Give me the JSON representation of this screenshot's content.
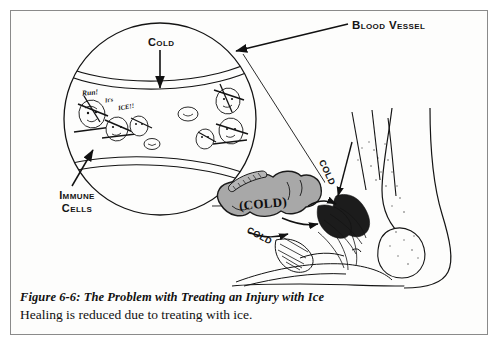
{
  "figure": {
    "caption_title": "Figure 6-6:  The Problem with Treating an Injury with Ice",
    "caption_subtitle": "Healing is reduced due to treating with ice.",
    "frame_border_color": "#8a8a8a",
    "background_color": "#fdfdfc",
    "ink_color": "#111111"
  },
  "labels": {
    "blood_vessel": "Blood Vessel",
    "cold_top": "Cold",
    "immune_cells_line1": "Immune",
    "immune_cells_line2": "Cells",
    "ice_pack": "(COLD)",
    "cold_arrow_upper": "COLD",
    "cold_arrow_lower": "COLD"
  },
  "cartoon_speech": {
    "run": "Run!",
    "its": "It's",
    "ice": "ICE!!"
  },
  "icepack": {
    "fill_color": "#a8a8a8",
    "outline_color": "#1a1a1a"
  },
  "magnifier": {
    "center_x": 160,
    "center_y": 119,
    "radius": 97
  }
}
